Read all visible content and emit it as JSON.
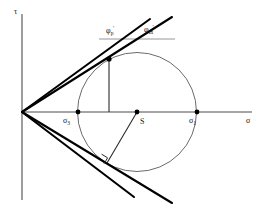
{
  "figure": {
    "kind": "mohr-circle-failure-envelope",
    "background_color": "#ffffff",
    "axes": {
      "vertical_label": "τ",
      "horizontal_label": "σ",
      "origin": {
        "x": 22,
        "y": 112
      },
      "vertical_top": {
        "x": 22,
        "y": 14
      },
      "vertical_bottom": {
        "x": 22,
        "y": 200
      },
      "horizontal_right": {
        "x": 252,
        "y": 112
      },
      "axis_color": "#4d4d4d"
    },
    "circle": {
      "center_label": "S",
      "center": {
        "x": 137,
        "y": 112
      },
      "radius": 59.5,
      "stroke_color": "#6b6b6b"
    },
    "points": [
      {
        "name": "sigma-3",
        "label": "σ",
        "subscript": "3",
        "x": 78,
        "y": 112
      },
      {
        "name": "sigma-1",
        "label": "σ",
        "subscript": "1",
        "x": 197,
        "y": 112
      },
      {
        "name": "circle-center",
        "label": "S",
        "subscript": "",
        "x": 137,
        "y": 112
      }
    ],
    "angles": [
      {
        "name": "peak-friction-angle",
        "symbol": "φ",
        "prime": "′",
        "subscript": "p",
        "description": "peak effective friction angle",
        "label_x": 106,
        "label_y": 27
      },
      {
        "name": "mobilized-friction-angle",
        "symbol": "φ",
        "prime": "′",
        "subscript": "m",
        "description": "mobilized effective friction angle",
        "label_x": 144,
        "label_y": 26
      }
    ],
    "envelopes": [
      {
        "name": "peak-envelope-upper",
        "from": {
          "x": 22,
          "y": 112
        },
        "to": {
          "x": 150,
          "y": 19
        },
        "stroke": "#000000",
        "width": 2.1
      },
      {
        "name": "mobilized-envelope-upper",
        "from": {
          "x": 22,
          "y": 112
        },
        "to": {
          "x": 172,
          "y": 17
        },
        "stroke": "#000000",
        "width": 2.1
      },
      {
        "name": "peak-envelope-lower",
        "from": {
          "x": 22,
          "y": 112
        },
        "to": {
          "x": 134,
          "y": 197
        },
        "stroke": "#000000",
        "width": 2.1
      },
      {
        "name": "mobilized-envelope-lower",
        "from": {
          "x": 22,
          "y": 112
        },
        "to": {
          "x": 172,
          "y": 203
        },
        "stroke": "#000000",
        "width": 2.1
      }
    ],
    "construction": {
      "vertical_drop": {
        "name": "tangent-point-vertical-drop",
        "from": {
          "x": 109,
          "y": 59
        },
        "to": {
          "x": 109,
          "y": 112
        }
      },
      "radius_to_tangent": {
        "name": "radius-to-lower-tangent-point",
        "from": {
          "x": 137,
          "y": 112
        },
        "to": {
          "x": 107,
          "y": 163
        }
      },
      "reference_line": {
        "name": "horizontal-angle-reference",
        "from": {
          "x": 99,
          "y": 39
        },
        "to": {
          "x": 175,
          "y": 39
        }
      },
      "right_angle_marker": {
        "name": "right-angle-marker",
        "x": 103,
        "y": 156,
        "size": 7
      }
    }
  }
}
